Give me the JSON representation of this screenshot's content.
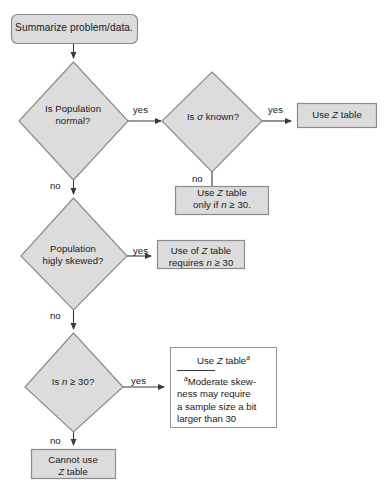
{
  "diagram": {
    "type": "flowchart",
    "colors": {
      "node_fill": "#dcdcdc",
      "node_stroke": "#8c8c8c",
      "callout_fill": "#ffffff",
      "connector": "#3a3a3a",
      "text": "#1a1a1a"
    }
  },
  "nodes": {
    "start": {
      "shape": "rounded-rectangle",
      "label": "Summarize problem/data."
    },
    "decision_normal": {
      "shape": "diamond",
      "line1": "Is Population",
      "line2": "normal?"
    },
    "decision_sigma": {
      "shape": "diamond",
      "prefix": "Is ",
      "symbol": "σ",
      "suffix": " known?"
    },
    "decision_skewed": {
      "shape": "diamond",
      "line1": "Population",
      "line2": "higly skewed?"
    },
    "decision_n30": {
      "shape": "diamond",
      "prefix": "Is ",
      "symbol": "n",
      "suffix": " ≥ 30?"
    },
    "use_z_table": {
      "shape": "rectangle",
      "prefix": "Use ",
      "symbol": "Z",
      "suffix": " table"
    },
    "use_z_only_if": {
      "shape": "rectangle",
      "line1_prefix": "Use ",
      "line1_symbol": "Z",
      "line1_suffix": " table",
      "line2_prefix": "only if ",
      "line2_symbol": "n",
      "line2_suffix": " ≥ 30."
    },
    "use_of_z_requires": {
      "shape": "rectangle",
      "line1_prefix": "Use of ",
      "line1_symbol": "Z",
      "line1_suffix": " table",
      "line2_prefix": "requires ",
      "line2_symbol": "n",
      "line2_suffix": " ≥ 30"
    },
    "use_z_footnote": {
      "shape": "rectangle-callout",
      "title_prefix": "Use ",
      "title_symbol": "Z",
      "title_suffix": " table",
      "title_superscript": "a",
      "footnote_marker": "a",
      "footnote_line1": "Moderate skew-",
      "footnote_line2": "ness may require",
      "footnote_line3": "a sample size a bit",
      "footnote_line4": "larger than 30"
    },
    "cannot_use": {
      "shape": "rectangle",
      "line1": "Cannot use",
      "line2_symbol": "Z",
      "line2_suffix": " table"
    }
  },
  "edges": {
    "yes_normal": "yes",
    "yes_sigma": "yes",
    "yes_skewed": "yes",
    "yes_n30": "yes",
    "no_normal": "no",
    "no_sigma": "no",
    "no_skewed": "no",
    "no_n30": "no"
  }
}
